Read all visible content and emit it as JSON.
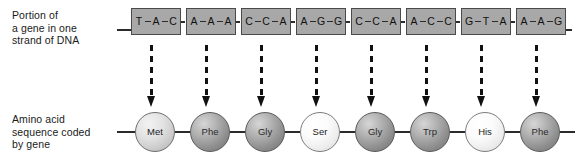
{
  "figure": {
    "type": "genetic-code-diagram",
    "dna_caption": "Portion of\na gene in one\nstrand of DNA",
    "amino_caption": "Amino acid\nsequence coded\nby gene"
  },
  "colors": {
    "codon_box_fill": "#a8a8a8",
    "codon_box_stroke": "#4a4a4a",
    "line": "#2b2b2b",
    "text": "#1a1a1a",
    "arrow": "#111111",
    "circle_light": "#fbfbfb",
    "circle_medium": "#e2e2e2",
    "circle_dark": "#b4b4b4"
  },
  "dna": {
    "codons": [
      {
        "id": 1,
        "bases": [
          "T",
          "A",
          "C"
        ],
        "x": 131
      },
      {
        "id": 2,
        "bases": [
          "A",
          "A",
          "A"
        ],
        "x": 186
      },
      {
        "id": 3,
        "bases": [
          "C",
          "C",
          "A"
        ],
        "x": 241
      },
      {
        "id": 4,
        "bases": [
          "A",
          "G",
          "G"
        ],
        "x": 296
      },
      {
        "id": 5,
        "bases": [
          "C",
          "C",
          "A"
        ],
        "x": 351
      },
      {
        "id": 6,
        "bases": [
          "A",
          "C",
          "C"
        ],
        "x": 406
      },
      {
        "id": 7,
        "bases": [
          "G",
          "T",
          "A"
        ],
        "x": 461
      },
      {
        "id": 8,
        "bases": [
          "A",
          "A",
          "G"
        ],
        "x": 516
      }
    ]
  },
  "arrows": [
    {
      "id": 1,
      "x": 151
    },
    {
      "id": 2,
      "x": 206
    },
    {
      "id": 3,
      "x": 261
    },
    {
      "id": 4,
      "x": 316
    },
    {
      "id": 5,
      "x": 371
    },
    {
      "id": 6,
      "x": 426
    },
    {
      "id": 7,
      "x": 481
    },
    {
      "id": 8,
      "x": 536
    }
  ],
  "protein": {
    "residues": [
      {
        "id": 1,
        "label": "Met",
        "shade": "medium",
        "x": 135
      },
      {
        "id": 2,
        "label": "Phe",
        "shade": "dark",
        "x": 190
      },
      {
        "id": 3,
        "label": "Gly",
        "shade": "dark",
        "x": 245
      },
      {
        "id": 4,
        "label": "Ser",
        "shade": "light",
        "x": 300
      },
      {
        "id": 5,
        "label": "Gly",
        "shade": "dark",
        "x": 355
      },
      {
        "id": 6,
        "label": "Trp",
        "shade": "dark",
        "x": 410
      },
      {
        "id": 7,
        "label": "His",
        "shade": "light",
        "x": 465
      },
      {
        "id": 8,
        "label": "Phe",
        "shade": "dark",
        "x": 520
      }
    ]
  }
}
